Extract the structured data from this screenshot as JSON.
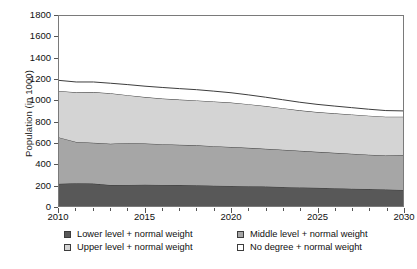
{
  "chart_data": {
    "type": "area",
    "title": "",
    "subtitle": "",
    "xlabel": "",
    "ylabel": "Population (in 1000)",
    "stacked": true,
    "grid": false,
    "legend_position": "bottom",
    "xlim": [
      2010,
      2030
    ],
    "ylim": [
      0,
      1800
    ],
    "x_tick_labels": [
      "2010",
      "2015",
      "2020",
      "2025",
      "2030"
    ],
    "x_tick_values": [
      2010,
      2015,
      2020,
      2025,
      2030
    ],
    "x_minor_tick_step": 1,
    "y_tick_labels": [
      "0",
      "200",
      "400",
      "600",
      "800",
      "1000",
      "1200",
      "1400",
      "1600",
      "1800"
    ],
    "y_tick_values": [
      0,
      200,
      400,
      600,
      800,
      1000,
      1200,
      1400,
      1600,
      1800
    ],
    "x": [
      2010,
      2011,
      2012,
      2013,
      2014,
      2015,
      2016,
      2017,
      2018,
      2019,
      2020,
      2021,
      2022,
      2023,
      2024,
      2025,
      2026,
      2027,
      2028,
      2029,
      2030
    ],
    "series": [
      {
        "name": "Lower level + normal weight",
        "color": "#585858",
        "values": [
          210,
          215,
          212,
          198,
          200,
          202,
          200,
          198,
          196,
          193,
          190,
          187,
          184,
          180,
          176,
          172,
          168,
          164,
          160,
          156,
          152
        ]
      },
      {
        "name": "Middle level + normal weight",
        "color": "#a6a6a6",
        "values": [
          440,
          392,
          387,
          392,
          398,
          390,
          386,
          382,
          379,
          374,
          369,
          364,
          358,
          353,
          347,
          341,
          336,
          331,
          326,
          322,
          328
        ]
      },
      {
        "name": "Upper level + normal weight",
        "color": "#d4d4d4",
        "values": [
          440,
          470,
          480,
          478,
          452,
          440,
          432,
          428,
          425,
          423,
          421,
          414,
          405,
          394,
          383,
          377,
          374,
          372,
          370,
          368,
          366
        ]
      },
      {
        "name": "No degree + normal weight",
        "color": "#ffffff",
        "values": [
          100,
          98,
          96,
          95,
          100,
          103,
          105,
          104,
          102,
          98,
          93,
          88,
          84,
          80,
          77,
          73,
          69,
          65,
          61,
          58,
          55
        ]
      }
    ],
    "cumulative_tops": {
      "lower": [
        210,
        215,
        212,
        198,
        200,
        202,
        200,
        198,
        196,
        193,
        190,
        187,
        184,
        180,
        176,
        172,
        168,
        164,
        160,
        156,
        152
      ],
      "middle": [
        650,
        607,
        599,
        590,
        598,
        592,
        586,
        580,
        575,
        567,
        559,
        551,
        542,
        533,
        523,
        513,
        504,
        495,
        486,
        478,
        480
      ],
      "upper": [
        1090,
        1077,
        1079,
        1068,
        1050,
        1032,
        1018,
        1008,
        1000,
        990,
        980,
        965,
        947,
        927,
        906,
        890,
        878,
        867,
        856,
        846,
        846
      ],
      "total": [
        1190,
        1175,
        1175,
        1163,
        1150,
        1135,
        1123,
        1112,
        1102,
        1088,
        1073,
        1053,
        1031,
        1007,
        983,
        963,
        947,
        932,
        917,
        904,
        901
      ]
    }
  },
  "axes": {
    "y_title": "Population (in 1000)",
    "y_ticks": [
      {
        "label": "1800",
        "value": 1800
      },
      {
        "label": "1600",
        "value": 1600
      },
      {
        "label": "1400",
        "value": 1400
      },
      {
        "label": "1200",
        "value": 1200
      },
      {
        "label": "1000",
        "value": 1000
      },
      {
        "label": "800",
        "value": 800
      },
      {
        "label": "600",
        "value": 600
      },
      {
        "label": "400",
        "value": 400
      },
      {
        "label": "200",
        "value": 200
      },
      {
        "label": "0",
        "value": 0
      }
    ],
    "x_ticks": [
      {
        "label": "2010",
        "value": 2010
      },
      {
        "label": "2015",
        "value": 2015
      },
      {
        "label": "2020",
        "value": 2020
      },
      {
        "label": "2025",
        "value": 2025
      },
      {
        "label": "2030",
        "value": 2030
      }
    ]
  },
  "legend": {
    "rows": [
      {
        "left": {
          "label": "Lower level + normal weight",
          "color": "#585858"
        },
        "right": {
          "label": "Middle level + normal weight",
          "color": "#a6a6a6"
        }
      },
      {
        "left": {
          "label": "Upper level + normal weight",
          "color": "#d4d4d4"
        },
        "right": {
          "label": "No degree + normal weight",
          "color": "#ffffff"
        }
      }
    ]
  }
}
